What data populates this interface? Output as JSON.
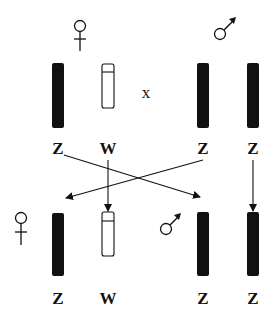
{
  "parents": {
    "female": {
      "symbol": "female-symbol",
      "chromosomes": [
        {
          "label": "Z",
          "fill": "#111111"
        },
        {
          "label": "W",
          "fill": "#ffffff"
        }
      ]
    },
    "cross_symbol": "x",
    "male": {
      "symbol": "male-symbol",
      "chromosomes": [
        {
          "label": "Z",
          "fill": "#111111"
        },
        {
          "label": "Z",
          "fill": "#111111"
        }
      ]
    }
  },
  "offspring": {
    "female": {
      "symbol": "female-symbol",
      "chromosomes": [
        {
          "label": "Z",
          "fill": "#111111"
        },
        {
          "label": "W",
          "fill": "#ffffff"
        }
      ]
    },
    "male": {
      "symbol": "male-symbol",
      "chromosomes": [
        {
          "label": "Z",
          "fill": "#111111"
        },
        {
          "label": "Z",
          "fill": "#111111"
        }
      ]
    }
  },
  "inheritance_arrows": [
    {
      "from": "mother Z",
      "to": "son Z"
    },
    {
      "from": "mother W",
      "to": "daughter W"
    },
    {
      "from": "father Z",
      "to": "daughter Z"
    },
    {
      "from": "father Z",
      "to": "son Z"
    }
  ],
  "colors": {
    "ink": "#111111",
    "background": "#ffffff"
  }
}
